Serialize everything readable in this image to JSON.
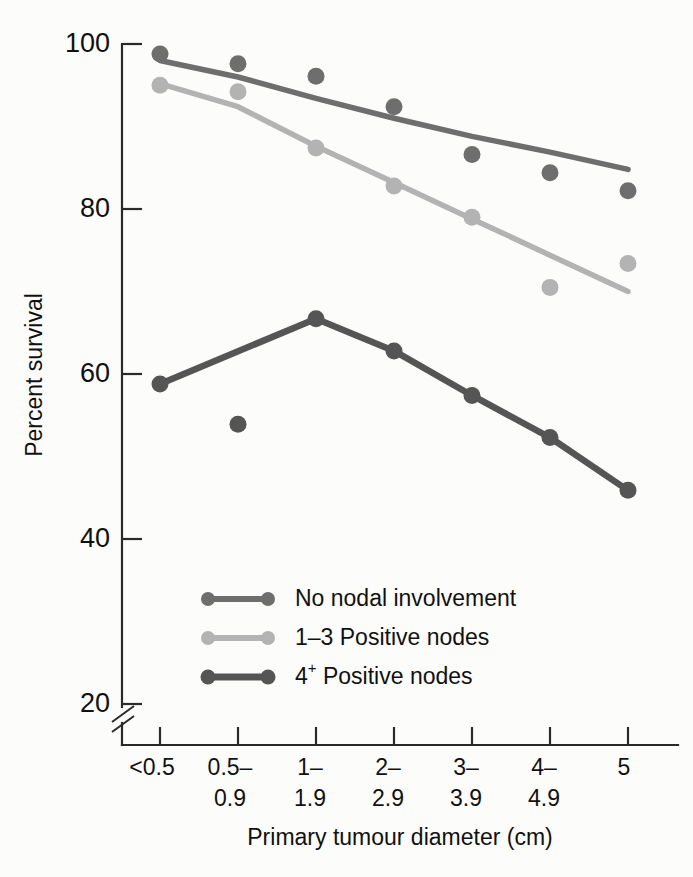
{
  "chart_data": {
    "type": "line",
    "title": "",
    "xlabel": "Primary tumour diameter (cm)",
    "ylabel": "Percent survival",
    "categories": [
      "<0.5",
      "0.5– 0.9",
      "1– 1.9",
      "2– 2.9",
      "3– 3.9",
      "4– 4.9",
      "5"
    ],
    "category_lines": [
      [
        "<0.5",
        ""
      ],
      [
        "0.5–",
        "0.9"
      ],
      [
        "1–",
        "1.9"
      ],
      [
        "2–",
        "2.9"
      ],
      [
        "3–",
        "3.9"
      ],
      [
        "4–",
        "4.9"
      ],
      [
        "5",
        ""
      ]
    ],
    "ylim": [
      18,
      100
    ],
    "yticks": [
      20,
      40,
      60,
      80,
      100
    ],
    "ytick_labels": [
      "20",
      "40",
      "60",
      "80",
      "100"
    ],
    "y_axis_break": true,
    "grid": false,
    "legend_position": "lower-center-inside",
    "series": [
      {
        "name": "No nodal involvement",
        "color": "#6e6e6e",
        "marker_color": "#6e6e6e",
        "values": [
          98.8,
          97.6,
          96.1,
          92.4,
          86.6,
          84.4,
          82.2
        ],
        "fit_line": [
          98.0,
          96.0,
          93.4,
          91.0,
          88.8,
          86.9,
          84.8
        ]
      },
      {
        "name": "1–3 Positive nodes",
        "color": "#b3b3b3",
        "marker_color": "#b3b3b3",
        "values": [
          95.0,
          94.2,
          87.4,
          82.8,
          79.0,
          70.5,
          73.4
        ],
        "fit_line": [
          95.2,
          92.4,
          87.6,
          83.2,
          78.8,
          74.4,
          70.0
        ]
      },
      {
        "name": "4⁺ Positive nodes",
        "color": "#555555",
        "marker_color": "#555555",
        "values": [
          58.8,
          53.9,
          66.7,
          62.8,
          57.4,
          52.3,
          45.9
        ],
        "fit_line": [
          58.8,
          null,
          66.7,
          62.8,
          57.4,
          52.3,
          45.9
        ],
        "fit_note": "peak at category 1–1.9"
      }
    ],
    "legend": [
      {
        "label": "No nodal involvement",
        "color": "#6e6e6e"
      },
      {
        "label": "1–3 Positive nodes",
        "color": "#b3b3b3"
      },
      {
        "label": "4",
        "sup": "+",
        "label_rest": " Positive nodes",
        "color": "#555555"
      }
    ]
  },
  "colors": {
    "background": "#fcfcfb",
    "axis": "#2a2a2a",
    "text": "#111111",
    "series_no_nodal": "#6e6e6e",
    "series_1_3": "#b3b3b3",
    "series_4plus": "#555555"
  }
}
